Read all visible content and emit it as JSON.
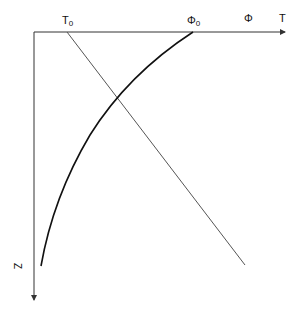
{
  "diagram": {
    "type": "profile-plot",
    "axes": {
      "horizontal_labels": {
        "phi": "Φ",
        "t": "T"
      },
      "vertical_label": "Z"
    },
    "markers": {
      "t0": {
        "base": "T",
        "sub": "0"
      },
      "phi0": {
        "base": "Φ",
        "sub": "0"
      }
    },
    "curves": [
      {
        "name": "T",
        "shape": "straight line",
        "description": "temperature decreasing linearly with depth from T0"
      },
      {
        "name": "Φ",
        "shape": "concave curve",
        "description": "Φ decreasing nonlinearly with depth from Φ0"
      }
    ],
    "colors": {
      "axis": "#333333",
      "t_line": "#555555",
      "phi_curve": "#111111"
    }
  }
}
